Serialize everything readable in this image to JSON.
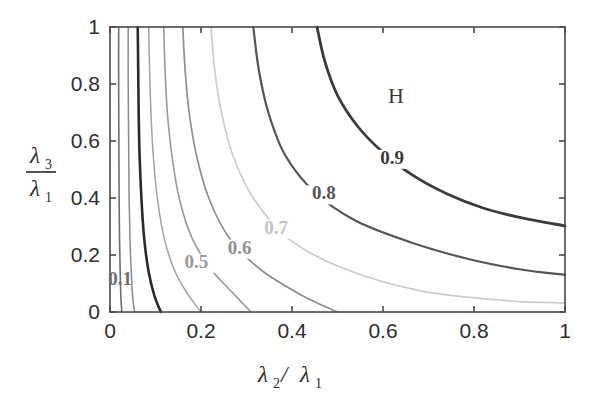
{
  "figure": {
    "background_color": "#ffffff",
    "frame_color": "#4a4a4a"
  },
  "axes": {
    "x": {
      "label_main": "λ",
      "label_sub": "2",
      "label_sep": " / ",
      "label_main2": "λ",
      "label_sub2": "1",
      "ticks": [
        "0",
        "0.2",
        "0.4",
        "0.6",
        "0.8",
        "1"
      ],
      "tick_values": [
        0,
        0.2,
        0.4,
        0.6,
        0.8,
        1
      ],
      "range": [
        0,
        1
      ]
    },
    "y": {
      "label_num_main": "λ",
      "label_num_sub": "3",
      "label_den_main": "λ",
      "label_den_sub": "1",
      "ticks": [
        "0",
        "0.2",
        "0.4",
        "0.6",
        "0.8",
        "1"
      ],
      "tick_values": [
        0,
        0.2,
        0.4,
        0.6,
        0.8,
        1
      ],
      "range": [
        0,
        1
      ]
    }
  },
  "annotations": {
    "region": {
      "text": "H",
      "x": 0.645,
      "y": 0.785
    }
  },
  "chart_data": {
    "type": "contour",
    "title": "",
    "xlabel": "λ2 / λ1",
    "ylabel": "λ3 / λ1",
    "xlim": [
      0,
      1
    ],
    "ylim": [
      0,
      1
    ],
    "grid": false,
    "legend": "none",
    "annotations": [
      "H"
    ],
    "levels": [
      0.1,
      0.2,
      0.3,
      0.4,
      0.5,
      0.6,
      0.7,
      0.8,
      0.9
    ],
    "labeled_levels": [
      "0.1",
      "0.5",
      "0.6",
      "0.7",
      "0.8",
      "0.9"
    ],
    "contours": [
      {
        "level": 0.1,
        "label": "0.1",
        "color": "#6e6e6e",
        "width": 1.6,
        "label_pos": {
          "x": 0.022,
          "y": 0.095
        },
        "points": [
          [
            0.019,
            1.0
          ],
          [
            0.019,
            0.8
          ],
          [
            0.0195,
            0.6
          ],
          [
            0.02,
            0.4
          ],
          [
            0.021,
            0.25
          ],
          [
            0.0225,
            0.13
          ],
          [
            0.024,
            0.05
          ],
          [
            0.026,
            0.0
          ]
        ]
      },
      {
        "level": 0.2,
        "label": "",
        "color": "#8a8a8a",
        "width": 1.5,
        "label_pos": null,
        "points": [
          [
            0.04,
            1.0
          ],
          [
            0.04,
            0.8
          ],
          [
            0.041,
            0.6
          ],
          [
            0.042,
            0.4
          ],
          [
            0.044,
            0.25
          ],
          [
            0.047,
            0.13
          ],
          [
            0.05,
            0.05
          ],
          [
            0.054,
            0.0
          ]
        ]
      },
      {
        "level": 0.3,
        "label": "",
        "color": "#2a2a2a",
        "width": 2.6,
        "label_pos": null,
        "points": [
          [
            0.061,
            1.0
          ],
          [
            0.062,
            0.85
          ],
          [
            0.063,
            0.7
          ],
          [
            0.065,
            0.55
          ],
          [
            0.069,
            0.4
          ],
          [
            0.075,
            0.26
          ],
          [
            0.085,
            0.14
          ],
          [
            0.098,
            0.055
          ],
          [
            0.112,
            0.0
          ]
        ]
      },
      {
        "level": 0.4,
        "label": "",
        "color": "#a2a2a2",
        "width": 1.5,
        "label_pos": null,
        "points": [
          [
            0.085,
            1.0
          ],
          [
            0.087,
            0.85
          ],
          [
            0.09,
            0.7
          ],
          [
            0.095,
            0.55
          ],
          [
            0.104,
            0.4
          ],
          [
            0.119,
            0.26
          ],
          [
            0.142,
            0.145
          ],
          [
            0.172,
            0.06
          ],
          [
            0.2,
            0.0
          ]
        ]
      },
      {
        "level": 0.5,
        "label": "0.5",
        "color": "#9a9a9a",
        "width": 1.6,
        "label_pos": {
          "x": 0.19,
          "y": 0.155
        },
        "points": [
          [
            0.118,
            1.0
          ],
          [
            0.121,
            0.85
          ],
          [
            0.126,
            0.7
          ],
          [
            0.136,
            0.55
          ],
          [
            0.152,
            0.4
          ],
          [
            0.18,
            0.26
          ],
          [
            0.222,
            0.15
          ],
          [
            0.268,
            0.07
          ],
          [
            0.31,
            0.0
          ]
        ]
      },
      {
        "level": 0.6,
        "label": "0.6",
        "color": "#8f8f8f",
        "width": 1.7,
        "label_pos": {
          "x": 0.285,
          "y": 0.205
        },
        "points": [
          [
            0.16,
            1.0
          ],
          [
            0.165,
            0.85
          ],
          [
            0.174,
            0.7
          ],
          [
            0.19,
            0.55
          ],
          [
            0.217,
            0.4
          ],
          [
            0.262,
            0.26
          ],
          [
            0.33,
            0.15
          ],
          [
            0.42,
            0.06
          ],
          [
            0.5,
            0.0
          ]
        ]
      },
      {
        "level": 0.7,
        "label": "0.7",
        "color": "#cccccc",
        "width": 1.7,
        "label_pos": {
          "x": 0.365,
          "y": 0.275
        },
        "points": [
          [
            0.222,
            1.0
          ],
          [
            0.23,
            0.85
          ],
          [
            0.245,
            0.7
          ],
          [
            0.27,
            0.55
          ],
          [
            0.315,
            0.4
          ],
          [
            0.39,
            0.26
          ],
          [
            0.51,
            0.155
          ],
          [
            0.68,
            0.075
          ],
          [
            0.87,
            0.04
          ],
          [
            1.0,
            0.032
          ]
        ]
      },
      {
        "level": 0.8,
        "label": "0.8",
        "color": "#555555",
        "width": 2.2,
        "label_pos": {
          "x": 0.47,
          "y": 0.395
        },
        "points": [
          [
            0.315,
            1.0
          ],
          [
            0.327,
            0.85
          ],
          [
            0.348,
            0.7
          ],
          [
            0.385,
            0.55
          ],
          [
            0.45,
            0.42
          ],
          [
            0.54,
            0.32
          ],
          [
            0.66,
            0.245
          ],
          [
            0.79,
            0.185
          ],
          [
            0.9,
            0.15
          ],
          [
            1.0,
            0.13
          ]
        ]
      },
      {
        "level": 0.9,
        "label": "0.9",
        "color": "#3b3b3b",
        "width": 2.8,
        "label_pos": {
          "x": 0.62,
          "y": 0.52
        },
        "points": [
          [
            0.455,
            1.0
          ],
          [
            0.472,
            0.88
          ],
          [
            0.5,
            0.76
          ],
          [
            0.545,
            0.65
          ],
          [
            0.6,
            0.56
          ],
          [
            0.665,
            0.48
          ],
          [
            0.74,
            0.415
          ],
          [
            0.82,
            0.365
          ],
          [
            0.9,
            0.332
          ],
          [
            1.0,
            0.302
          ]
        ]
      }
    ]
  }
}
